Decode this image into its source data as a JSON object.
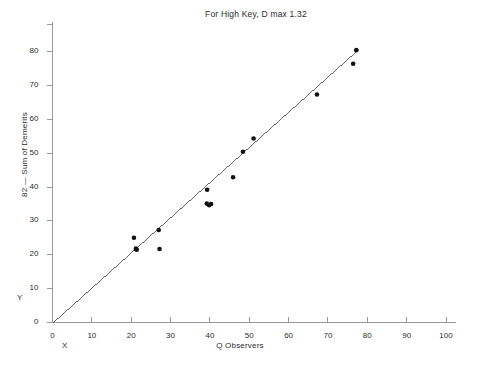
{
  "chart_data": {
    "type": "scatter",
    "title": "For High Key, D max 1.32",
    "xlabel": "Q Observers",
    "ylabel": "82 — Sum of Demerits",
    "corner_x_label": "X",
    "corner_y_label": "Y",
    "xlim": [
      0,
      100
    ],
    "ylim": [
      0,
      85
    ],
    "xticks": [
      0,
      10,
      20,
      30,
      40,
      50,
      60,
      70,
      80,
      90,
      100
    ],
    "yticks": [
      0,
      10,
      20,
      30,
      40,
      50,
      60,
      70,
      80
    ],
    "xtick_labels": [
      "0",
      "10",
      "20",
      "30",
      "40",
      "50",
      "60",
      "70",
      "80",
      "90",
      "100"
    ],
    "ytick_labels": [
      "0",
      "10",
      "20",
      "30",
      "40",
      "50",
      "60",
      "70",
      "80"
    ],
    "grid": false,
    "legend": false,
    "marker_color": "#111111",
    "line_color": "#555555",
    "axis_color": "#999999",
    "points": [
      {
        "x": 20.7,
        "y": 25.0
      },
      {
        "x": 21.2,
        "y": 21.8
      },
      {
        "x": 21.4,
        "y": 21.5
      },
      {
        "x": 27.0,
        "y": 27.3
      },
      {
        "x": 27.2,
        "y": 21.7
      },
      {
        "x": 39.3,
        "y": 39.2
      },
      {
        "x": 39.2,
        "y": 35.1
      },
      {
        "x": 39.8,
        "y": 34.6
      },
      {
        "x": 40.3,
        "y": 35.0
      },
      {
        "x": 45.9,
        "y": 42.9
      },
      {
        "x": 48.4,
        "y": 50.4
      },
      {
        "x": 51.1,
        "y": 54.3
      },
      {
        "x": 67.2,
        "y": 67.3
      },
      {
        "x": 76.4,
        "y": 76.4
      },
      {
        "x": 77.2,
        "y": 80.4
      }
    ],
    "fit_line": {
      "x0": 0,
      "y0": 0,
      "x1": 78.0,
      "y1": 81.0
    }
  }
}
